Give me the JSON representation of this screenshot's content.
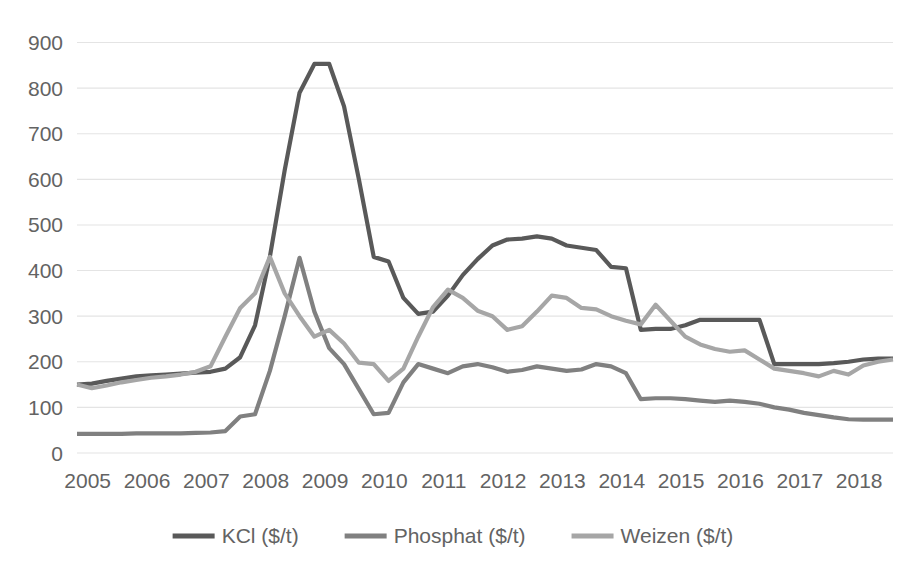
{
  "chart_data": {
    "type": "line",
    "title": "",
    "subtitle": "",
    "xlabel": "",
    "ylabel": "",
    "ylim": [
      0,
      900
    ],
    "ytick_step": 100,
    "grid": true,
    "grid_axis": "y",
    "legend_position": "bottom",
    "yticks": [
      "0",
      "100",
      "200",
      "300",
      "400",
      "500",
      "600",
      "700",
      "800",
      "900"
    ],
    "categories": [
      "2005",
      "2006",
      "2007",
      "2008",
      "2009",
      "2010",
      "2011",
      "2012",
      "2013",
      "2014",
      "2015",
      "2016",
      "2017",
      "2018"
    ],
    "x_range": [
      2005.0,
      2018.75
    ],
    "series": [
      {
        "name": "KCl ($/t)",
        "color": "#595959",
        "x": [
          2005.0,
          2005.25,
          2005.5,
          2005.75,
          2006.0,
          2006.25,
          2006.5,
          2006.75,
          2007.0,
          2007.25,
          2007.5,
          2007.75,
          2008.0,
          2008.25,
          2008.5,
          2008.75,
          2009.0,
          2009.25,
          2009.5,
          2009.75,
          2010.0,
          2010.25,
          2010.5,
          2010.75,
          2011.0,
          2011.25,
          2011.5,
          2011.75,
          2012.0,
          2012.25,
          2012.5,
          2012.75,
          2013.0,
          2013.25,
          2013.5,
          2013.75,
          2014.0,
          2014.25,
          2014.5,
          2014.75,
          2015.0,
          2015.25,
          2015.5,
          2015.75,
          2016.0,
          2016.25,
          2016.5,
          2016.75,
          2017.0,
          2017.25,
          2017.5,
          2017.75,
          2018.0,
          2018.25,
          2018.5,
          2018.75
        ],
        "values": [
          150,
          152,
          158,
          163,
          168,
          170,
          172,
          174,
          176,
          178,
          185,
          210,
          280,
          430,
          620,
          790,
          853,
          853,
          760,
          600,
          430,
          420,
          340,
          305,
          310,
          345,
          390,
          425,
          455,
          468,
          470,
          475,
          470,
          455,
          450,
          445,
          408,
          405,
          270,
          272,
          272,
          280,
          292,
          292,
          292,
          292,
          292,
          195,
          195,
          195,
          195,
          197,
          200,
          205,
          207,
          207
        ]
      },
      {
        "name": "Phosphat ($/t)",
        "color": "#808080",
        "x": [
          2005.0,
          2005.25,
          2005.5,
          2005.75,
          2006.0,
          2006.25,
          2006.5,
          2006.75,
          2007.0,
          2007.25,
          2007.5,
          2007.75,
          2008.0,
          2008.25,
          2008.5,
          2008.75,
          2009.0,
          2009.25,
          2009.5,
          2009.75,
          2010.0,
          2010.25,
          2010.5,
          2010.75,
          2011.0,
          2011.25,
          2011.5,
          2011.75,
          2012.0,
          2012.25,
          2012.5,
          2012.75,
          2013.0,
          2013.25,
          2013.5,
          2013.75,
          2014.0,
          2014.25,
          2014.5,
          2014.75,
          2015.0,
          2015.25,
          2015.5,
          2015.75,
          2016.0,
          2016.25,
          2016.5,
          2016.75,
          2017.0,
          2017.25,
          2017.5,
          2017.75,
          2018.0,
          2018.25,
          2018.5,
          2018.75
        ],
        "values": [
          42,
          42,
          42,
          42,
          43,
          43,
          43,
          43,
          44,
          45,
          48,
          80,
          85,
          180,
          300,
          428,
          310,
          230,
          195,
          140,
          85,
          88,
          155,
          195,
          185,
          175,
          190,
          195,
          188,
          178,
          182,
          190,
          185,
          180,
          183,
          195,
          190,
          175,
          118,
          120,
          120,
          118,
          115,
          112,
          115,
          112,
          108,
          100,
          95,
          88,
          83,
          78,
          74,
          73,
          73,
          73
        ]
      },
      {
        "name": "Weizen ($/t)",
        "color": "#a6a6a6",
        "x": [
          2005.0,
          2005.25,
          2005.5,
          2005.75,
          2006.0,
          2006.25,
          2006.5,
          2006.75,
          2007.0,
          2007.25,
          2007.5,
          2007.75,
          2008.0,
          2008.25,
          2008.5,
          2008.75,
          2009.0,
          2009.25,
          2009.5,
          2009.75,
          2010.0,
          2010.25,
          2010.5,
          2010.75,
          2011.0,
          2011.25,
          2011.5,
          2011.75,
          2012.0,
          2012.25,
          2012.5,
          2012.75,
          2013.0,
          2013.25,
          2013.5,
          2013.75,
          2014.0,
          2014.25,
          2014.5,
          2014.75,
          2015.0,
          2015.25,
          2015.5,
          2015.75,
          2016.0,
          2016.25,
          2016.5,
          2016.75,
          2017.0,
          2017.25,
          2017.5,
          2017.75,
          2018.0,
          2018.25,
          2018.5,
          2018.75
        ],
        "values": [
          150,
          142,
          148,
          155,
          160,
          165,
          168,
          172,
          178,
          190,
          255,
          318,
          350,
          430,
          350,
          300,
          255,
          270,
          240,
          198,
          195,
          158,
          185,
          255,
          320,
          358,
          340,
          312,
          300,
          270,
          278,
          310,
          345,
          340,
          318,
          315,
          300,
          290,
          282,
          325,
          290,
          255,
          238,
          228,
          222,
          225,
          205,
          185,
          180,
          175,
          168,
          180,
          172,
          192,
          200,
          205
        ]
      }
    ]
  },
  "legend": {
    "items": [
      {
        "label": "KCl ($/t)",
        "color": "#595959"
      },
      {
        "label": "Phosphat ($/t)",
        "color": "#808080"
      },
      {
        "label": "Weizen ($/t)",
        "color": "#a6a6a6"
      }
    ]
  }
}
